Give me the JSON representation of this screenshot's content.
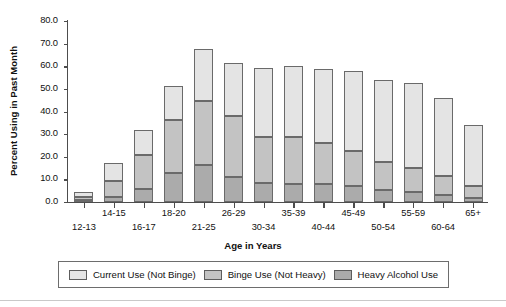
{
  "chart_data": {
    "type": "bar",
    "stacked": true,
    "title": "",
    "xlabel": "Age in Years",
    "ylabel": "Percent Using in Past Month",
    "ylim": [
      0.0,
      80.0
    ],
    "ytick_step": 10.0,
    "ytick_labels": [
      "0.0",
      "10.0",
      "20.0",
      "30.0",
      "40.0",
      "50.0",
      "60.0",
      "70.0",
      "80.0"
    ],
    "ytick_values": [
      0.0,
      10.0,
      20.0,
      30.0,
      40.0,
      50.0,
      60.0,
      70.0,
      80.0
    ],
    "grid": false,
    "legend_position": "bottom",
    "categories": [
      "12-13",
      "14-15",
      "16-17",
      "18-20",
      "21-25",
      "26-29",
      "30-34",
      "35-39",
      "40-44",
      "45-49",
      "50-54",
      "55-59",
      "60-64",
      "65+"
    ],
    "series": [
      {
        "name": "Heavy Alcohol Use",
        "color": "#ababab",
        "values": [
          1.0,
          2.3,
          5.6,
          13.0,
          16.2,
          10.9,
          8.5,
          8.0,
          8.1,
          7.0,
          5.4,
          4.3,
          3.3,
          1.9
        ]
      },
      {
        "name": "Binge Use (Not Heavy)",
        "color": "#c3c3c3",
        "values": [
          1.4,
          7.1,
          15.4,
          23.1,
          28.4,
          27.0,
          20.4,
          20.8,
          17.9,
          15.6,
          12.2,
          10.7,
          8.4,
          5.1
        ]
      },
      {
        "name": "Current Use (Not Binge)",
        "color": "#e4e4e4",
        "values": [
          1.9,
          7.9,
          10.8,
          15.1,
          23.0,
          23.4,
          30.3,
          31.1,
          33.0,
          35.4,
          36.2,
          37.5,
          34.2,
          27.2
        ]
      }
    ],
    "totals": [
      4.3,
      17.3,
      31.8,
      51.2,
      67.6,
      61.3,
      59.2,
      59.9,
      59.0,
      58.0,
      53.8,
      52.5,
      45.9,
      34.2
    ]
  },
  "legend": {
    "items": [
      {
        "label": "Current Use (Not Binge)",
        "key": "current"
      },
      {
        "label": "Binge Use (Not Heavy)",
        "key": "binge"
      },
      {
        "label": "Heavy Alcohol Use",
        "key": "heavy"
      }
    ]
  },
  "colors": {
    "current_use": "#e4e4e4",
    "binge_use": "#c3c3c3",
    "heavy_use": "#ababab",
    "axis": "#4d4d4d",
    "outline": "#6a6a6a",
    "text": "#111111"
  }
}
